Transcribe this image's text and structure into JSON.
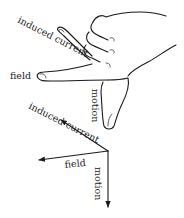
{
  "hand_labels": {
    "induced_current": "induced current",
    "field": "field",
    "motion": "motion"
  },
  "vector_labels": {
    "induced_current": "induced current",
    "field": "field",
    "motion": "motion"
  },
  "vectors": {
    "origin": [
      108,
      151
    ],
    "induced_current_tip": [
      61,
      120
    ],
    "field_tip": [
      39,
      160
    ],
    "motion_tip": [
      108,
      207
    ]
  },
  "colors": {
    "ink": "#1a1a1a",
    "background": "#ffffff"
  }
}
